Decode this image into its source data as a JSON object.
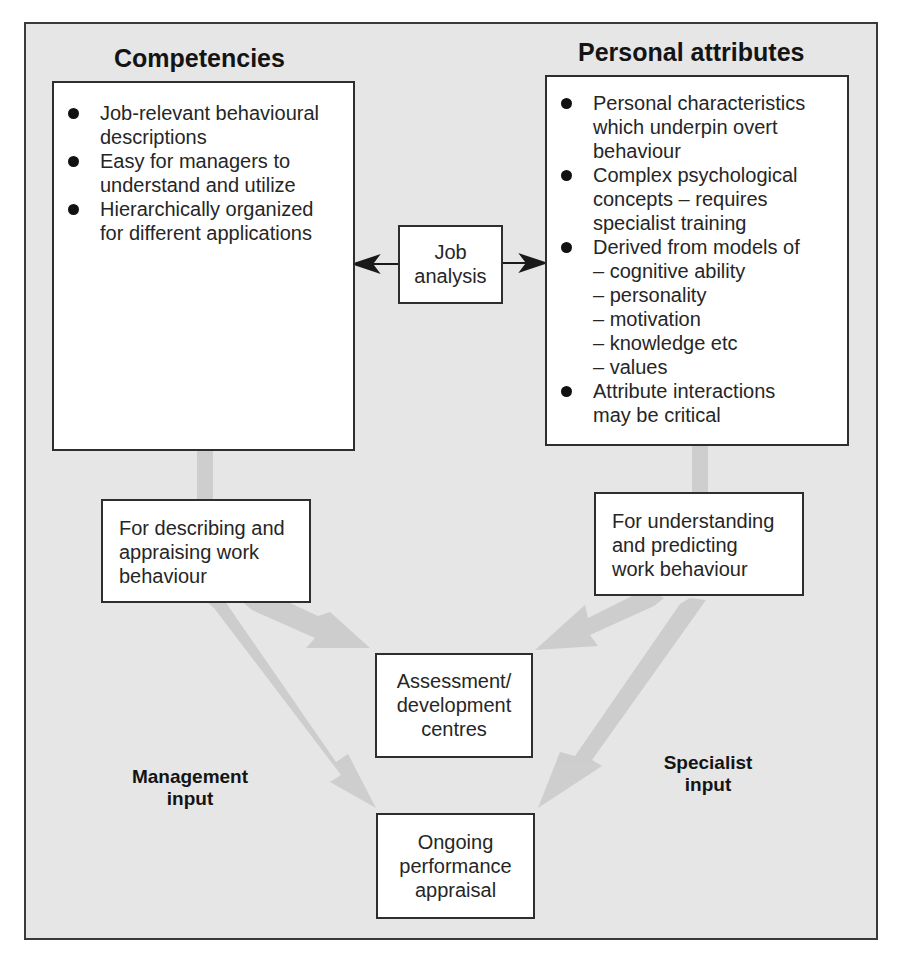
{
  "diagram": {
    "left_column": {
      "heading": "Competencies",
      "bullets": [
        [
          "Job-relevant behavioural",
          "descriptions"
        ],
        [
          "Easy for managers to",
          "understand and utilize"
        ],
        [
          "Hierarchically organized",
          "for different applications"
        ]
      ],
      "purpose_box": [
        "For describing and",
        "appraising work",
        "behaviour"
      ],
      "input_label": [
        "Management",
        "input"
      ]
    },
    "right_column": {
      "heading": "Personal attributes",
      "bullets": [
        [
          "Personal characteristics",
          "which underpin overt",
          "behaviour"
        ],
        [
          "Complex psychological",
          "concepts – requires",
          "specialist training"
        ],
        [
          "Derived from models of",
          "– cognitive ability",
          "– personality",
          "– motivation",
          "– knowledge etc",
          "– values"
        ],
        [
          "Attribute interactions",
          "may be critical"
        ]
      ],
      "purpose_box": [
        "For understanding",
        "and predicting",
        "work behaviour"
      ],
      "input_label": [
        "Specialist",
        "input"
      ]
    },
    "center": {
      "job_analysis": [
        "Job",
        "analysis"
      ],
      "assessment": [
        "Assessment/",
        "development",
        "centres"
      ],
      "appraisal": [
        "Ongoing",
        "performance",
        "appraisal"
      ]
    },
    "colors": {
      "background": "#e6e6e6",
      "box_fill": "#ffffff",
      "border": "#2e2e2e",
      "flow_arrow": "#cdcdcd"
    }
  }
}
